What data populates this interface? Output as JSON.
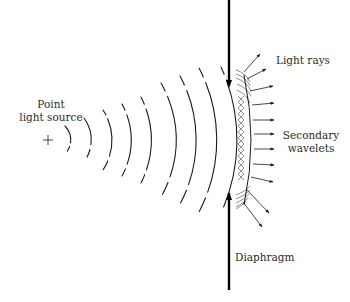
{
  "diagram": {
    "labels": {
      "source_line1": "Point",
      "source_line2": "light source",
      "light_rays": "Light rays",
      "secondary_line1": "Secondary",
      "secondary_line2": "wavelets",
      "diaphragm": "Diaphragm"
    },
    "source_marker": "+",
    "colors": {
      "ink": "#1a1a1a",
      "background": "#ffffff"
    },
    "wavefront_count": 9,
    "ray_count": 11
  }
}
